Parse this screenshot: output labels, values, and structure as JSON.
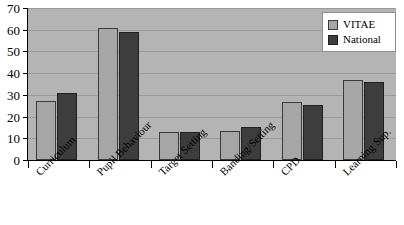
{
  "chart_data": {
    "type": "bar",
    "title": "",
    "xlabel": "",
    "ylabel": "",
    "categories": [
      "Curriculum",
      "Pupil Behaviour",
      "Target Setting",
      "Banding/Setting",
      "CPD",
      "Learning Sup."
    ],
    "series": [
      {
        "name": "VITAE",
        "color": "#a6a6a6",
        "values": [
          27,
          61,
          13,
          13.5,
          26.5,
          37
        ]
      },
      {
        "name": "National",
        "color": "#3d3d3d",
        "values": [
          31,
          59,
          13,
          15,
          25.5,
          36
        ]
      }
    ],
    "ylim": [
      0,
      70
    ],
    "ytick_labels": [
      "0",
      "10",
      "20",
      "30",
      "40",
      "50",
      "60",
      "70"
    ],
    "ytick_values": [
      0,
      10,
      20,
      30,
      40,
      50,
      60,
      70
    ],
    "grid": true,
    "legend_position": "top-right",
    "plot_background": "#b4b4b4",
    "gridline_color": "#9a9a9a",
    "axis_color": "#000000"
  }
}
